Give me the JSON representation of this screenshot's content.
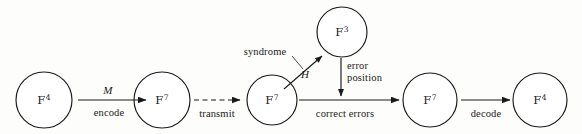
{
  "figure": {
    "background_color": "#fdfdfc",
    "stroke_color": "#1a1a1a"
  },
  "nodes": [
    {
      "id": "n1",
      "field": "F",
      "exponent": "4",
      "cx": 44,
      "cy": 100,
      "r": 28
    },
    {
      "id": "n2",
      "field": "F",
      "exponent": "7",
      "cx": 162,
      "cy": 100,
      "r": 28
    },
    {
      "id": "n3",
      "field": "F",
      "exponent": "7",
      "cx": 272,
      "cy": 100,
      "r": 25
    },
    {
      "id": "n4",
      "field": "F",
      "exponent": "3",
      "cx": 342,
      "cy": 32,
      "r": 25
    },
    {
      "id": "n5",
      "field": "F",
      "exponent": "7",
      "cx": 430,
      "cy": 100,
      "r": 27
    },
    {
      "id": "n6",
      "field": "F",
      "exponent": "4",
      "cx": 540,
      "cy": 100,
      "r": 27
    }
  ],
  "edges": [
    {
      "id": "e1",
      "from": "n1",
      "to": "n2",
      "style": "solid",
      "label_above": "M",
      "label_below": "encode"
    },
    {
      "id": "e2",
      "from": "n2",
      "to": "n3",
      "style": "dashed",
      "label_above": "",
      "label_below": "transmit"
    },
    {
      "id": "e3",
      "from": "n3",
      "to": "n4",
      "style": "solid-diagonal",
      "label_above": "",
      "label_below": "H"
    },
    {
      "id": "e4",
      "from": "n4",
      "to": "e5",
      "style": "solid-vertical",
      "label_above": "",
      "label_below": "error\nposition"
    },
    {
      "id": "e5",
      "from": "n3",
      "to": "n5",
      "style": "solid",
      "label_above": "",
      "label_below": "correct errors"
    },
    {
      "id": "e6",
      "from": "n5",
      "to": "n6",
      "style": "solid",
      "label_above": "",
      "label_below": "decode"
    }
  ],
  "annotations": [
    {
      "id": "a1",
      "text": "syndrome",
      "x": 265,
      "y": 51,
      "leader_to_x": 297,
      "leader_to_y": 72
    }
  ],
  "labels": {
    "node_1": "F",
    "node_1_sup": "4",
    "node_2": "F",
    "node_2_sup": "7",
    "node_3": "F",
    "node_3_sup": "7",
    "node_4": "F",
    "node_4_sup": "3",
    "node_5": "F",
    "node_5_sup": "7",
    "node_6": "F",
    "node_6_sup": "4",
    "edge_encode_symbol": "M",
    "edge_encode_text": "encode",
    "edge_transmit_text": "transmit",
    "edge_h_symbol": "H",
    "edge_error_position_line1": "error",
    "edge_error_position_line2": "position",
    "edge_correct_errors_text": "correct errors",
    "edge_decode_text": "decode",
    "annotation_syndrome": "syndrome"
  }
}
